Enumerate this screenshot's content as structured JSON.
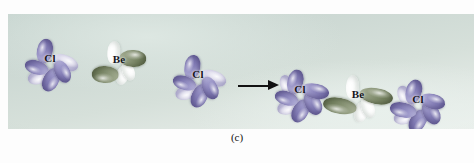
{
  "figure": {
    "caption": "(c)",
    "panel": {
      "background_color": "#ccd8d3",
      "edge_color": "#e8eeea"
    },
    "colors": {
      "chlorine_orbital": "#817bb4",
      "chlorine_orbital_pale": "#cfcce4",
      "beryllium_sp_orbital": "#73805f",
      "unhybridized_p_orbital": "#ffffff",
      "label_text": "#15151a",
      "arrow": "#111111"
    },
    "reactants": {
      "label": "reactants",
      "atoms": [
        {
          "symbol": "Cl",
          "name": "chlorine-atom-left",
          "orbital_type": "p"
        },
        {
          "symbol": "Be",
          "name": "beryllium-atom",
          "orbital_type": "sp-hybrid"
        },
        {
          "symbol": "Cl",
          "name": "chlorine-atom-right",
          "orbital_type": "p"
        }
      ]
    },
    "arrow": {
      "name": "reaction-arrow",
      "direction": "right"
    },
    "product": {
      "label": "product",
      "formula": "BeCl2",
      "geometry": "linear",
      "atoms": [
        {
          "symbol": "Cl",
          "name": "chlorine-atom-left",
          "orbital_type": "p"
        },
        {
          "symbol": "Be",
          "name": "beryllium-atom",
          "orbital_type": "sp-hybrid"
        },
        {
          "symbol": "Cl",
          "name": "chlorine-atom-right",
          "orbital_type": "p"
        }
      ]
    }
  },
  "labels": {
    "cl1": "Cl",
    "be1": "Be",
    "cl2": "Cl",
    "cl3": "Cl",
    "be2": "Be",
    "cl4": "Cl"
  }
}
